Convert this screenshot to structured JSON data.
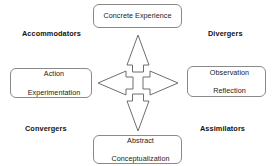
{
  "diagram": {
    "background_color": "#ffffff",
    "node_border_color": "#8a8a8a",
    "arrow_stroke_color": "#6e6e6e",
    "text_color": "#1a1a1a",
    "nodes": [
      {
        "id": "concrete",
        "label": "Concrete Experience",
        "position": "top"
      },
      {
        "id": "action",
        "label": "Action\nExperimentation",
        "line1": "Action",
        "line2": "Experimentation",
        "position": "left"
      },
      {
        "id": "observation",
        "label": "Observation\nReflection",
        "line1": "Observation",
        "line2": "Reflection",
        "position": "right"
      },
      {
        "id": "abstract",
        "label": "Abstract\nConceptualization",
        "line1": "Abstract",
        "line2": "Conceptualization",
        "position": "bottom"
      }
    ],
    "corner_labels": [
      {
        "id": "accommodators",
        "label": "Accommodators",
        "position": "top-left"
      },
      {
        "id": "divergers",
        "label": "Divergers",
        "position": "top-right"
      },
      {
        "id": "convergers",
        "label": "Convergers",
        "position": "bottom-left"
      },
      {
        "id": "assimilators",
        "label": "Assimilators",
        "position": "bottom-right"
      }
    ],
    "center_graphic": {
      "name": "four-way-arrow",
      "directions": [
        "up",
        "right",
        "down",
        "left"
      ],
      "center_style": "open-square"
    }
  }
}
